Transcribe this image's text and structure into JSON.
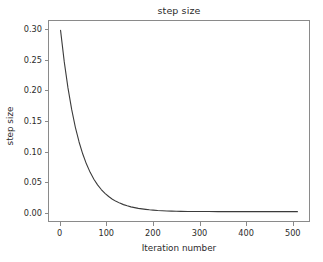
{
  "chart_data": {
    "type": "line",
    "title": "step size",
    "xlabel": "Iteration number",
    "ylabel": "step size",
    "xlim": [
      -25,
      537
    ],
    "ylim": [
      -0.0155,
      0.3155
    ],
    "grid": false,
    "legend": null,
    "line_color": "#3b3b3b",
    "line_width": 1.1,
    "xticks": [
      0,
      100,
      200,
      300,
      400,
      500
    ],
    "xtick_labels": [
      "0",
      "100",
      "200",
      "300",
      "400",
      "500"
    ],
    "yticks": [
      0.0,
      0.05,
      0.1,
      0.15,
      0.2,
      0.25,
      0.3
    ],
    "ytick_labels": [
      "0.00",
      "0.05",
      "0.10",
      "0.15",
      "0.20",
      "0.25",
      "0.30"
    ],
    "series": [
      {
        "name": "step size",
        "x": [
          0,
          8,
          16,
          24,
          32,
          40,
          48,
          56,
          64,
          72,
          80,
          88,
          96,
          104,
          112,
          120,
          128,
          136,
          144,
          152,
          160,
          168,
          176,
          184,
          192,
          200,
          210,
          220,
          230,
          240,
          250,
          260,
          275,
          290,
          305,
          320,
          340,
          360,
          380,
          400,
          430,
          460,
          490,
          512
        ],
        "y": [
          0.3,
          0.2478,
          0.2047,
          0.1691,
          0.1396,
          0.1153,
          0.0953,
          0.0787,
          0.065,
          0.0537,
          0.0443,
          0.0366,
          0.0303,
          0.025,
          0.0206,
          0.017,
          0.0141,
          0.0116,
          0.0096,
          0.0079,
          0.0066,
          0.0054,
          0.0045,
          0.0037,
          0.003,
          0.0025,
          0.0019,
          0.0015,
          0.0011,
          0.0009,
          0.0007,
          0.0005,
          0.0003,
          0.0002,
          0.0001,
          0.0001,
          0.0,
          0.0,
          0.0,
          0.0,
          0.0,
          0.0,
          0.0,
          0.0
        ]
      }
    ]
  },
  "figure": {
    "background_color": "#ffffff",
    "axes_edge_color": "#8a8a8a",
    "text_color": "#2b2b2b"
  }
}
